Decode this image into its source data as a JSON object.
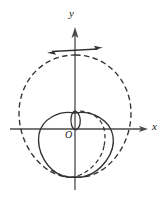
{
  "figure": {
    "background_color": "#ffffff",
    "stroke_color": "#333333",
    "axis_color": "#4a4a4a",
    "labels": {
      "y_axis": "y",
      "x_axis": "x",
      "origin": "O"
    },
    "axes": {
      "origin_px": [
        75,
        129
      ],
      "x_axis": {
        "x_start": 10,
        "x_end": 148,
        "y": 129,
        "arrow": "right"
      },
      "y_axis": {
        "y_start": 28,
        "y_end": 190,
        "x": 75,
        "arrow": "up"
      }
    },
    "tangent_line": {
      "name": "tangent-at-top",
      "from_px": [
        47,
        51
      ],
      "to_px": [
        103,
        49
      ],
      "touch_point_px": [
        75,
        55
      ],
      "arrows": "both",
      "style": "solid"
    },
    "curves": [
      {
        "name": "outer-dashed-cardioid",
        "style": "dashed",
        "description": "large cardioid opening downward, cusp at bottom on y-axis",
        "extent_px": {
          "left": 14,
          "right": 131,
          "top": 55,
          "bottom": 177
        }
      },
      {
        "name": "inner-solid-cardioid",
        "style": "solid",
        "description": "smaller cardioid opening downward, cusp at bottom on y-axis",
        "extent_px": {
          "left": 38,
          "right": 114,
          "top": 113,
          "bottom": 177
        }
      },
      {
        "name": "small-inner-loop",
        "style": "solid",
        "description": "narrow vertical loop near the origin",
        "extent_px": {
          "left": 71,
          "right": 80,
          "top": 111,
          "bottom": 129
        }
      },
      {
        "name": "small-inner-loop-dashed-arc",
        "style": "dashed",
        "description": "dashed arc over the small inner loop bending right",
        "extent_px": {
          "left": 75,
          "right": 104,
          "top": 110,
          "bottom": 129
        }
      }
    ]
  }
}
